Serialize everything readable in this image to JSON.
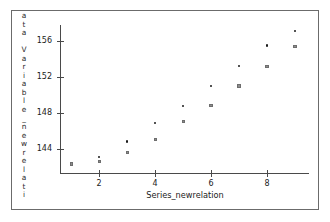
{
  "chart_data": {
    "type": "scatter",
    "title": "",
    "xlabel": "Series_newrelation",
    "ylabel": "ata Variable_newrelati",
    "ylabel_chars": [
      "a",
      "t",
      "a",
      "",
      "V",
      "a",
      "r",
      "i",
      "a",
      "b",
      "l",
      "e",
      "_",
      "n",
      "e",
      "w",
      "r",
      "e",
      "l",
      "a",
      "t",
      "i"
    ],
    "x": [
      1,
      2,
      3,
      4,
      5,
      6,
      7,
      8,
      9
    ],
    "xlim": [
      0.6,
      9.5
    ],
    "ylim": [
      141.3,
      157.8
    ],
    "xticks": [
      2,
      4,
      6,
      8
    ],
    "xtick_labels": [
      "2",
      "4",
      "6",
      "8"
    ],
    "yticks": [
      144,
      148,
      152,
      156
    ],
    "ytick_labels": [
      "144",
      "148",
      "152",
      "156"
    ],
    "grid": false,
    "legend": "none",
    "series": [
      {
        "name": "series-dot",
        "marker": "dot",
        "color": "#1a1a1a",
        "values": [
          142.3,
          143.1,
          144.8,
          146.9,
          148.8,
          151.0,
          153.2,
          155.5,
          157.1
        ]
      },
      {
        "name": "series-square",
        "marker": "square",
        "color": "#8d8d8d",
        "values": [
          142.3,
          142.6,
          143.6,
          145.0,
          147.0,
          148.8,
          151.0,
          153.2,
          155.4
        ]
      }
    ]
  },
  "frame": {
    "border_color": "#6b6b6b",
    "background": "#ffffff"
  }
}
